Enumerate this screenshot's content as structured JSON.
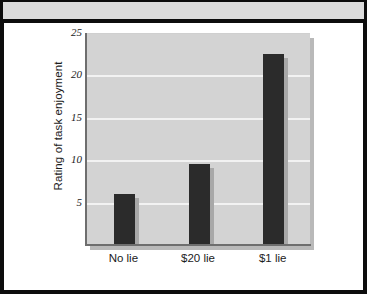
{
  "chart_data": {
    "type": "bar",
    "title": "",
    "xlabel": "",
    "ylabel": "Rating of task enjoyment",
    "categories": [
      "No lie",
      "$20 lie",
      "$1 lie"
    ],
    "values": [
      6,
      9.5,
      22.5
    ],
    "ylim": [
      0,
      25
    ],
    "yticks": [
      "5",
      "10",
      "15",
      "20",
      "25"
    ],
    "ytick_values": [
      5,
      10,
      15,
      20,
      25
    ],
    "grid": true,
    "legend": null,
    "bar_color": "#2b2b2b",
    "plot_background": "#d3d3d3",
    "gridline_color": "#f2f2f2"
  },
  "frame": {
    "border_color": "#0d0d0d",
    "band_color": "#dcdcdc",
    "page_background": "#ffffff"
  }
}
